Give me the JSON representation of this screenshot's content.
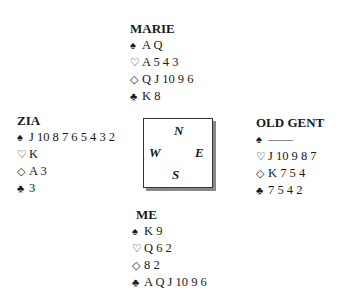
{
  "hands": {
    "north": {
      "name": "MARIE",
      "spades": "A Q",
      "hearts": "A 5 4 3",
      "diamonds": "Q J 10 9 6",
      "clubs": "K 8"
    },
    "west": {
      "name": "ZIA",
      "spades": "J 10 8 7 6 5 4 3 2",
      "hearts": "K",
      "diamonds": "A 3",
      "clubs": "3"
    },
    "east": {
      "name": "OLD GENT",
      "spades": "——",
      "hearts": "J 10 9 8 7",
      "diamonds": "K 7 5 4",
      "clubs": "7 5 4 2"
    },
    "south": {
      "name": "ME",
      "spades": "K 9",
      "hearts": "Q 6 2",
      "diamonds": "8 2",
      "clubs": "A Q J 10 9 6"
    }
  },
  "suits": {
    "spades": "♠",
    "hearts": "♡",
    "diamonds": "◇",
    "clubs": "♣"
  },
  "compass": {
    "n": "N",
    "s": "S",
    "e": "E",
    "w": "W"
  }
}
